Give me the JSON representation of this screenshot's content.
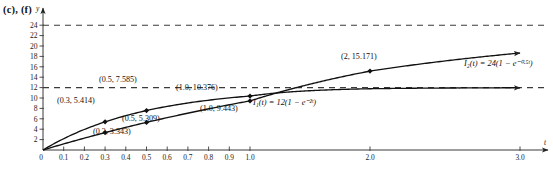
{
  "panel": {
    "label": "(c), (f)"
  },
  "chart_data": {
    "type": "line",
    "title": "",
    "xlabel": "t",
    "ylabel": "y",
    "grid": false,
    "legend": "inline-annotations",
    "xlim": [
      0,
      3.0
    ],
    "ylim": [
      0,
      25
    ],
    "x_axis_broken": true,
    "xticks": [
      0,
      0.1,
      0.2,
      0.3,
      0.4,
      0.5,
      0.6,
      0.7,
      0.8,
      0.9,
      1.0,
      2.0,
      3.0
    ],
    "xtick_labels": [
      "0",
      "0.1",
      "0.2",
      "0.3",
      "0.4",
      "0.5",
      "0.6",
      "0.7",
      "0.8",
      "0.9",
      "1.0",
      "2.0",
      "3.0"
    ],
    "yticks": [
      2,
      4,
      6,
      8,
      10,
      12,
      14,
      16,
      18,
      20,
      22,
      24
    ],
    "ytick_labels": [
      "2",
      "4",
      "6",
      "8",
      "10",
      "12",
      "14",
      "16",
      "18",
      "20",
      "22",
      "24"
    ],
    "asymptotes": [
      {
        "name": "asymptote-24",
        "y": 24,
        "style": "dashed"
      },
      {
        "name": "asymptote-12",
        "y": 12,
        "style": "dashed"
      }
    ],
    "series": [
      {
        "name": "I2",
        "equation": "I₂(t) = 24(1 − e⁻⁰·⁵ᵗ)",
        "amplitude": 24,
        "rate": 0.5,
        "arrow": true,
        "points": [
          {
            "x": 0.3,
            "y": 5.414,
            "label": "(0.3, 5.414)"
          },
          {
            "x": 0.5,
            "y": 7.585,
            "label": "(0.5, 7.585)"
          },
          {
            "x": 1.0,
            "y": 10.376,
            "label": "(1.0, 10.376)"
          },
          {
            "x": 2.0,
            "y": 15.171,
            "label": "(2, 15.171)"
          }
        ]
      },
      {
        "name": "I1",
        "equation": "I₁(t) = 12(1 − e⁻²ᵗ)",
        "amplitude": 12,
        "rate": 2,
        "arrow": true,
        "points": [
          {
            "x": 0.3,
            "y": 3.343,
            "label": "(0.3, 3.343)"
          },
          {
            "x": 0.5,
            "y": 5.309,
            "label": "(0.5, 5.309)"
          },
          {
            "x": 1.0,
            "y": 9.443,
            "label": "(1.0, 9.443)"
          }
        ]
      }
    ],
    "annotations": [
      {
        "name": "point-label-0-3-5-414",
        "text": "(0.3, 5.414)",
        "x": 57,
        "y": 103
      },
      {
        "name": "point-label-0-5-7-585",
        "text": "(0.5, 7.585)",
        "x": 99,
        "y": 82
      },
      {
        "name": "point-label-1-0-10-376",
        "text": "(1.0, 10.376)",
        "x": 176,
        "y": 90
      },
      {
        "name": "point-label-2-15-171",
        "text": "(2, 15.171)",
        "x": 341,
        "y": 59
      },
      {
        "name": "point-label-0-3-3-343",
        "text": "(0.3, 3.343)",
        "x": 93,
        "y": 134
      },
      {
        "name": "point-label-0-5-5-309",
        "text": "(0.5, 5.309)",
        "x": 122,
        "y": 121
      },
      {
        "name": "point-label-1-0-9-443",
        "text": "(1.0, 9.443)",
        "x": 200,
        "y": 111
      },
      {
        "name": "equation-label-i1",
        "text": "I₁(t) = 12(1 − e⁻²ᵗ)",
        "x": 253,
        "y": 105
      },
      {
        "name": "equation-label-i2",
        "text": "I₂(t) = 24(1 − e⁻⁰·⁵ᵗ)",
        "x": 464,
        "y": 66
      }
    ]
  }
}
